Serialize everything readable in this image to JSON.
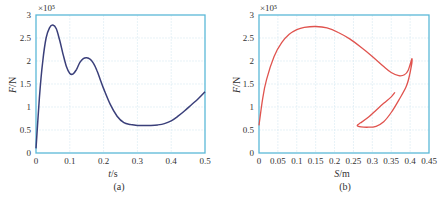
{
  "chart_data": [
    {
      "type": "line",
      "panel": "(a)",
      "title": "",
      "xlabel": "t/s",
      "ylabel": "F/N",
      "y_multiplier": "×10⁵",
      "xlim": [
        0,
        0.5
      ],
      "ylim": [
        0,
        3
      ],
      "grid": true,
      "xticks": [
        "0",
        "0.1",
        "0.2",
        "0.3",
        "0.4",
        "0.5"
      ],
      "yticks": [
        "0",
        "0.5",
        "1",
        "1.5",
        "2",
        "2.5",
        "3"
      ],
      "line_color": "#3a3f7a",
      "series": [
        {
          "name": "F(t)",
          "x": [
            0,
            0.01,
            0.02,
            0.03,
            0.04,
            0.05,
            0.06,
            0.07,
            0.08,
            0.09,
            0.1,
            0.11,
            0.12,
            0.13,
            0.14,
            0.15,
            0.16,
            0.17,
            0.18,
            0.19,
            0.2,
            0.22,
            0.24,
            0.26,
            0.28,
            0.3,
            0.32,
            0.34,
            0.36,
            0.38,
            0.4,
            0.42,
            0.44,
            0.46,
            0.48,
            0.5
          ],
          "y": [
            0.1,
            1.2,
            2.0,
            2.5,
            2.72,
            2.78,
            2.7,
            2.45,
            2.15,
            1.88,
            1.73,
            1.72,
            1.82,
            1.97,
            2.05,
            2.07,
            2.04,
            1.95,
            1.8,
            1.6,
            1.4,
            1.05,
            0.8,
            0.66,
            0.62,
            0.6,
            0.6,
            0.6,
            0.61,
            0.64,
            0.7,
            0.8,
            0.92,
            1.05,
            1.18,
            1.33
          ]
        }
      ]
    },
    {
      "type": "line",
      "panel": "(b)",
      "title": "",
      "xlabel": "S/m",
      "ylabel": "F/N",
      "y_multiplier": "×10⁵",
      "xlim": [
        0,
        0.45
      ],
      "ylim": [
        0,
        3
      ],
      "grid": true,
      "xticks": [
        "0",
        "0.05",
        "0.1",
        "0.15",
        "0.2",
        "0.25",
        "0.3",
        "0.35",
        "0.4",
        "0.45"
      ],
      "yticks": [
        "0",
        "0.5",
        "1",
        "1.5",
        "2",
        "2.5",
        "3"
      ],
      "line_color": "#e0534e",
      "series": [
        {
          "name": "F(S)",
          "x": [
            0,
            0.01,
            0.02,
            0.04,
            0.06,
            0.08,
            0.1,
            0.12,
            0.15,
            0.18,
            0.21,
            0.24,
            0.27,
            0.3,
            0.33,
            0.35,
            0.37,
            0.385,
            0.395,
            0.405,
            0.4,
            0.39,
            0.37,
            0.35,
            0.33,
            0.31,
            0.29,
            0.27,
            0.26,
            0.27,
            0.29,
            0.31,
            0.33,
            0.35,
            0.36
          ],
          "y": [
            0.6,
            1.2,
            1.6,
            2.1,
            2.4,
            2.58,
            2.68,
            2.73,
            2.75,
            2.72,
            2.62,
            2.48,
            2.3,
            2.1,
            1.88,
            1.75,
            1.68,
            1.7,
            1.8,
            2.05,
            1.75,
            1.45,
            1.15,
            0.88,
            0.68,
            0.58,
            0.56,
            0.57,
            0.6,
            0.66,
            0.78,
            0.93,
            1.08,
            1.22,
            1.32
          ]
        }
      ]
    }
  ],
  "panels": {
    "a": {
      "caption": "(a)",
      "xlabel_italic": "t",
      "xlabel_unit": "/s",
      "ylabel_italic": "F",
      "ylabel_unit": "/N",
      "multiplier": "×10⁵"
    },
    "b": {
      "caption": "(b)",
      "xlabel_italic": "S",
      "xlabel_unit": "/m",
      "ylabel_italic": "F",
      "ylabel_unit": "/N",
      "multiplier": "×10⁵"
    }
  }
}
